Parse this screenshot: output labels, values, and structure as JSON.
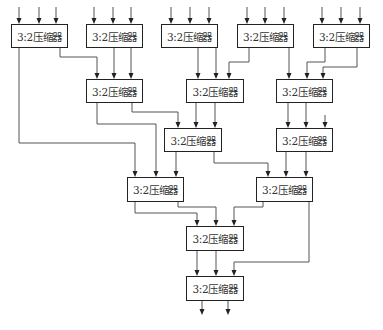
{
  "diagram": {
    "type": "Wallace tree of 3:2 compressors",
    "block_label": "3:2压缩器",
    "nodes": [
      {
        "id": "A",
        "label": "3:2压缩器",
        "level": 1,
        "x": 11,
        "y": 24,
        "w": 57,
        "h": 24
      },
      {
        "id": "B",
        "label": "3:2压缩器",
        "level": 1,
        "x": 86,
        "y": 24,
        "w": 57,
        "h": 24
      },
      {
        "id": "C",
        "label": "3:2压缩器",
        "level": 1,
        "x": 161,
        "y": 24,
        "w": 57,
        "h": 24
      },
      {
        "id": "D",
        "label": "3:2压缩器",
        "level": 1,
        "x": 237,
        "y": 24,
        "w": 57,
        "h": 24
      },
      {
        "id": "E",
        "label": "3:2压缩器",
        "level": 1,
        "x": 313,
        "y": 24,
        "w": 57,
        "h": 24
      },
      {
        "id": "F",
        "label": "3:2压缩器",
        "level": 2,
        "x": 86,
        "y": 79,
        "w": 57,
        "h": 24
      },
      {
        "id": "G",
        "label": "3:2压缩器",
        "level": 2,
        "x": 186,
        "y": 79,
        "w": 58,
        "h": 24
      },
      {
        "id": "H",
        "label": "3:2压缩器",
        "level": 2,
        "x": 276,
        "y": 79,
        "w": 57,
        "h": 24
      },
      {
        "id": "I",
        "label": "3:2压缩器",
        "level": 3,
        "x": 164,
        "y": 128,
        "w": 58,
        "h": 24
      },
      {
        "id": "J",
        "label": "3:2压缩器",
        "level": 3,
        "x": 276,
        "y": 128,
        "w": 57,
        "h": 24
      },
      {
        "id": "K",
        "label": "3:2压缩器",
        "level": 4,
        "x": 127,
        "y": 177,
        "w": 57,
        "h": 25
      },
      {
        "id": "L",
        "label": "3:2压缩器",
        "level": 4,
        "x": 256,
        "y": 177,
        "w": 57,
        "h": 25
      },
      {
        "id": "M",
        "label": "3:2压缩器",
        "level": 5,
        "x": 186,
        "y": 226,
        "w": 58,
        "h": 25
      },
      {
        "id": "N",
        "label": "3:2压缩器",
        "level": 6,
        "x": 186,
        "y": 276,
        "w": 58,
        "h": 25
      }
    ],
    "edges": [
      {
        "from": "input",
        "to": "A",
        "count": 3
      },
      {
        "from": "input",
        "to": "B",
        "count": 3
      },
      {
        "from": "input",
        "to": "C",
        "count": 3
      },
      {
        "from": "input",
        "to": "D",
        "count": 3
      },
      {
        "from": "input",
        "to": "E",
        "count": 3
      },
      {
        "from": "A",
        "to": "F"
      },
      {
        "from": "B",
        "to": "F",
        "count": 2
      },
      {
        "from": "A",
        "to": "K"
      },
      {
        "from": "C",
        "to": "G",
        "count": 2
      },
      {
        "from": "D",
        "to": "G"
      },
      {
        "from": "D",
        "to": "H"
      },
      {
        "from": "E",
        "to": "H",
        "count": 2
      },
      {
        "from": "F",
        "to": "I"
      },
      {
        "from": "G",
        "to": "I",
        "count": 2
      },
      {
        "from": "F",
        "to": "K"
      },
      {
        "from": "H",
        "to": "J",
        "count": 2
      },
      {
        "from": "input",
        "to": "J",
        "count": 1
      },
      {
        "from": "I",
        "to": "K"
      },
      {
        "from": "I",
        "to": "L"
      },
      {
        "from": "J",
        "to": "L",
        "count": 2
      },
      {
        "from": "K",
        "to": "M",
        "count": 2
      },
      {
        "from": "L",
        "to": "M"
      },
      {
        "from": "L",
        "to": "N"
      },
      {
        "from": "M",
        "to": "N",
        "count": 2
      },
      {
        "from": "N",
        "to": "output",
        "count": 2
      }
    ]
  }
}
